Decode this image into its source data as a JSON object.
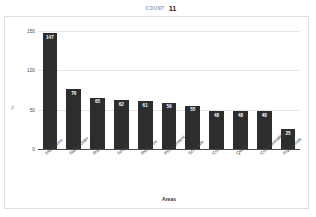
{
  "header": {
    "count_label": "COUNT",
    "count_value": "11"
  },
  "chart_data": {
    "type": "bar",
    "title": "",
    "xlabel": "Areas",
    "ylabel": "%",
    "categories": [
      "Integration",
      "Stakeholder",
      "Risk",
      "Scope",
      "Resource",
      "Procurement",
      "Schedule",
      "Cost",
      "Quality",
      "Communication",
      "Framework"
    ],
    "values": [
      147,
      76,
      65,
      62,
      61,
      59,
      55,
      48,
      48,
      48,
      25
    ],
    "value_labels": [
      "147",
      "76",
      "65",
      "62",
      "61",
      "59",
      "55",
      "48",
      "48",
      "48",
      "25"
    ],
    "ylim": [
      0,
      150
    ],
    "yticks": [
      0,
      50,
      100,
      150
    ],
    "ytick_labels": [
      "0",
      "50",
      "100",
      "150"
    ],
    "grid": true,
    "legend": "none",
    "bar_color": "#2d2d2d",
    "value_label_color": "#ffffff",
    "gridline_color": "#e6e6e6",
    "axis_color": "#4a4a4a"
  }
}
